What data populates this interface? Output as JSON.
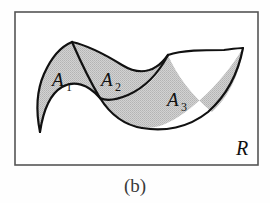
{
  "figure": {
    "caption": "(b)",
    "universe_label": "R",
    "frame": {
      "x": 14,
      "y": 11,
      "width": 245,
      "height": 155,
      "border_color": "#555555",
      "background_color": "#ffffff"
    },
    "style": {
      "region_fill": "#c9c9c9",
      "region_stroke": "#111111",
      "divider_stroke": "#111111",
      "stroke_width": 2.2
    },
    "regions": [
      {
        "id": "A1",
        "label": "A",
        "subscript": "1",
        "label_x": 52,
        "label_y": 86,
        "fill": "#c9c9c9"
      },
      {
        "id": "A2",
        "label": "A",
        "subscript": "2",
        "label_x": 101,
        "label_y": 86,
        "fill": "#c9c9c9"
      },
      {
        "id": "A3",
        "label": "A",
        "subscript": "3",
        "label_x": 167,
        "label_y": 106,
        "fill": "#c9c9c9"
      }
    ],
    "universe_label_pos": {
      "x": 236,
      "y": 155
    },
    "caption_pos": {
      "x": 135,
      "y": 192
    }
  }
}
